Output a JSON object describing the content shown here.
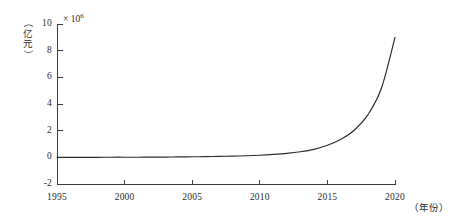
{
  "chart_data": {
    "type": "line",
    "title": "",
    "xlabel": "（年份）",
    "ylabel": "（亿元）",
    "y_multiplier_text": "× 10",
    "y_multiplier_exponent": "6",
    "y_multiplier_value": 1000000,
    "xlim": [
      1995,
      2020
    ],
    "ylim": [
      -2,
      10
    ],
    "grid": false,
    "legend": null,
    "x_ticks": [
      "1995",
      "2000",
      "2005",
      "2010",
      "2015",
      "2020"
    ],
    "x_tick_values": [
      1995,
      2000,
      2005,
      2010,
      2015,
      2020
    ],
    "y_ticks": [
      "-2",
      "0",
      "2",
      "4",
      "6",
      "8",
      "10"
    ],
    "y_tick_values": [
      -2,
      0,
      2,
      4,
      6,
      8,
      10
    ],
    "series": [
      {
        "name": "",
        "color": "#2b2b2b",
        "x": [
          1995,
          1996,
          1997,
          1998,
          1999,
          2000,
          2001,
          2002,
          2003,
          2004,
          2005,
          2006,
          2007,
          2008,
          2009,
          2010,
          2011,
          2012,
          2013,
          2014,
          2015,
          2016,
          2017,
          2018,
          2019,
          2020
        ],
        "values": [
          0.0,
          0.0,
          0.0,
          0.0,
          0.01,
          0.01,
          0.01,
          0.02,
          0.02,
          0.03,
          0.04,
          0.05,
          0.07,
          0.09,
          0.12,
          0.16,
          0.22,
          0.3,
          0.42,
          0.6,
          0.9,
          1.35,
          2.05,
          3.2,
          5.2,
          9.0
        ]
      }
    ]
  },
  "axes": {
    "x_axis_name": "x-axis",
    "y_axis_name": "y-axis"
  }
}
